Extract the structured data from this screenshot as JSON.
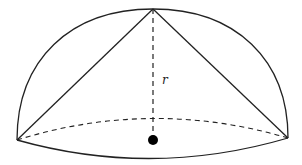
{
  "diagram": {
    "type": "hemisphere-with-inscribed-cone",
    "labels": {
      "radius": "r"
    },
    "colors": {
      "stroke": "#222222",
      "background": "#ffffff",
      "center_dot": "#000000"
    }
  }
}
